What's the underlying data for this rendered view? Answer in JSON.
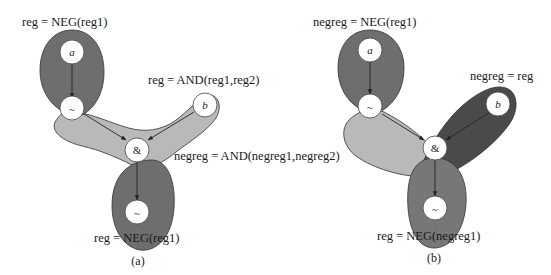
{
  "colors": {
    "dark": "#6e6e6e",
    "darker": "#4a4a4a",
    "light": "#b9b9b9",
    "node_fill": "#ffffff"
  },
  "panel_a": {
    "caption": "(a)",
    "labels": {
      "top": "reg = NEG(reg1)",
      "right_top": "reg = AND(reg1,reg2)",
      "right_mid": "negreg = AND(negreg1,negreg2)",
      "bottom": "reg = NEG(reg1)"
    },
    "nodes": {
      "a": "a",
      "neg_top": "~",
      "b": "b",
      "and": "&",
      "neg_bottom": "~"
    }
  },
  "panel_b": {
    "caption": "(b)",
    "labels": {
      "top": "negreg = NEG(reg1)",
      "right_top": "negreg = reg",
      "bottom": "reg = NEG(negreg1)"
    },
    "nodes": {
      "a": "a",
      "neg_top": "~",
      "b": "b",
      "and": "&",
      "neg_bottom": "~"
    }
  }
}
